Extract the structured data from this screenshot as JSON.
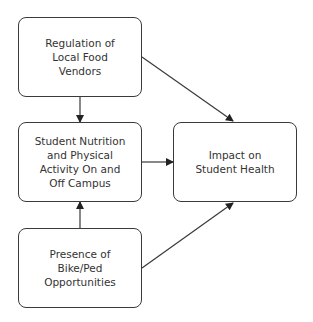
{
  "nodes": [
    {
      "id": "regulation",
      "label": "Regulation of\nLocal Food\nVendors"
    },
    {
      "id": "nutrition",
      "label": "Student Nutrition\nand Physical\nActivity On and\nOff Campus"
    },
    {
      "id": "bikeped",
      "label": "Presence of\nBike/Ped\nOpportunities"
    },
    {
      "id": "impact",
      "label": "Impact on\nStudent Health"
    }
  ],
  "edges": [
    {
      "from": "regulation",
      "to": "nutrition"
    },
    {
      "from": "regulation",
      "to": "impact"
    },
    {
      "from": "nutrition",
      "to": "impact"
    },
    {
      "from": "bikeped",
      "to": "nutrition"
    },
    {
      "from": "bikeped",
      "to": "impact"
    }
  ],
  "colors": {
    "stroke": "#3a3a3a",
    "text": "#333333",
    "background": "#ffffff"
  }
}
